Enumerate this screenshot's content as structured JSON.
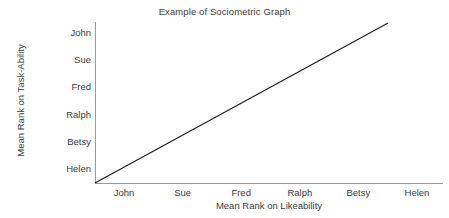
{
  "chart_data": {
    "type": "line",
    "title": "Example of Sociometric Graph",
    "xlabel": "Mean Rank on Likeability",
    "ylabel": "Mean Rank on Task-Ability",
    "x_tick_labels": [
      "John",
      "Sue",
      "Fred",
      "Ralph",
      "Betsy",
      "Helen"
    ],
    "y_tick_labels": [
      "John",
      "Sue",
      "Fred",
      "Ralph",
      "Betsy",
      "Helen"
    ],
    "x_tick_order_note": "left to right",
    "y_tick_order_note": "top to bottom",
    "grid": false,
    "legend": "none",
    "series": [
      {
        "name": "perfect positive correlation",
        "x": [
          0,
          6
        ],
        "y": [
          0,
          6
        ],
        "points": [
          {
            "x_label": "origin",
            "y_label": "origin"
          },
          {
            "x_label": "Betsy",
            "y_label": "John"
          }
        ],
        "line_color": "#1a1a1a",
        "line_width": 1
      }
    ],
    "xlim": [
      0,
      6.5
    ],
    "ylim": [
      0,
      6.2
    ],
    "axis_color": "#9a9a9a",
    "text_color": "#3c3c3c",
    "background_color": "#ffffff"
  }
}
